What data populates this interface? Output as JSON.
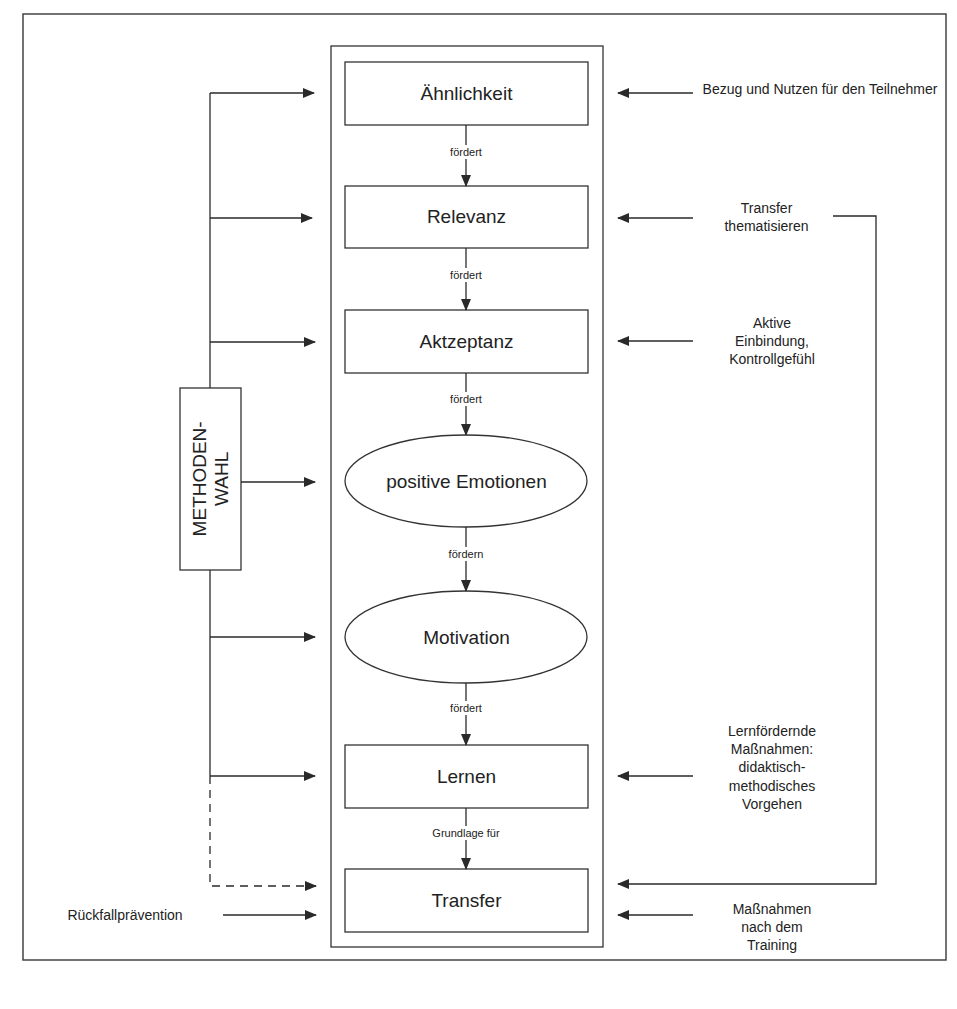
{
  "diagram": {
    "center_nodes": [
      {
        "id": "aehnlichkeit",
        "label": "Ähnlichkeit",
        "shape": "rect"
      },
      {
        "id": "relevanz",
        "label": "Relevanz",
        "shape": "rect"
      },
      {
        "id": "aktzeptanz",
        "label": "Aktzeptanz",
        "shape": "rect"
      },
      {
        "id": "emotionen",
        "label": "positive Emotionen",
        "shape": "ellipse"
      },
      {
        "id": "motivation",
        "label": "Motivation",
        "shape": "ellipse"
      },
      {
        "id": "lernen",
        "label": "Lernen",
        "shape": "rect"
      },
      {
        "id": "transfer",
        "label": "Transfer",
        "shape": "rect"
      }
    ],
    "center_edges": [
      {
        "from": "aehnlichkeit",
        "to": "relevanz",
        "label": "fördert"
      },
      {
        "from": "relevanz",
        "to": "aktzeptanz",
        "label": "fördert"
      },
      {
        "from": "aktzeptanz",
        "to": "emotionen",
        "label": "fördert"
      },
      {
        "from": "emotionen",
        "to": "motivation",
        "label": "fördern"
      },
      {
        "from": "motivation",
        "to": "lernen",
        "label": "fördert"
      },
      {
        "from": "lernen",
        "to": "transfer",
        "label": "Grundlage für"
      }
    ],
    "left": {
      "methodenwahl": {
        "line1": "METHODEN-",
        "line2": "WAHL"
      },
      "rueckfall": "Rückfallprävention"
    },
    "right": {
      "bezug": "Bezug und Nutzen für den Teilnehmer",
      "transfer_thema_1": "Transfer",
      "transfer_thema_2": "thematisieren",
      "aktive_1": "Aktive",
      "aktive_2": "Einbindung,",
      "aktive_3": "Kontrollgefühl",
      "lernf_1": "Lernfördernde",
      "lernf_2": "Maßnahmen:",
      "lernf_3": "didaktisch-",
      "lernf_4": "methodisches",
      "lernf_5": "Vorgehen",
      "nach_1": "Maßnahmen",
      "nach_2": "nach dem",
      "nach_3": "Training"
    },
    "colors": {
      "line": "#2a2a2a",
      "background": "#ffffff",
      "text": "#222222"
    }
  }
}
